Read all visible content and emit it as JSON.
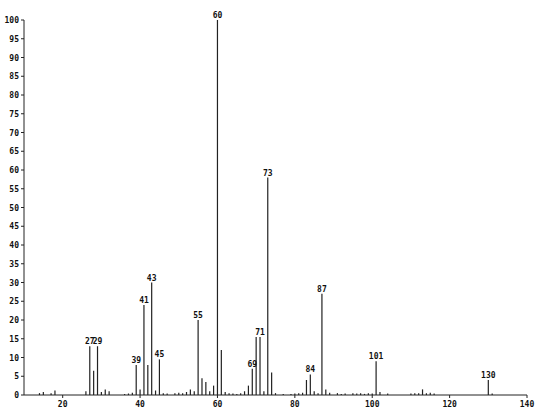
{
  "chart_data": {
    "type": "bar",
    "title": "",
    "xlabel": "",
    "ylabel": "",
    "xlim": [
      10,
      140
    ],
    "ylim": [
      0,
      100
    ],
    "grid": false,
    "legend": null,
    "x_ticks": [
      20,
      40,
      60,
      80,
      100,
      120,
      140
    ],
    "y_ticks": [
      0,
      5,
      10,
      15,
      20,
      25,
      30,
      35,
      40,
      45,
      50,
      55,
      60,
      65,
      70,
      75,
      80,
      85,
      90,
      95,
      100
    ],
    "labeled_peaks": [
      27,
      29,
      39,
      41,
      43,
      45,
      55,
      60,
      69,
      71,
      73,
      84,
      87,
      101,
      130
    ],
    "x": [
      14,
      15,
      17,
      18,
      26,
      27,
      28,
      29,
      30,
      31,
      32,
      36,
      37,
      38,
      39,
      40,
      41,
      42,
      43,
      44,
      45,
      46,
      47,
      49,
      50,
      51,
      52,
      53,
      54,
      55,
      56,
      57,
      58,
      59,
      60,
      61,
      62,
      63,
      64,
      65,
      66,
      67,
      68,
      69,
      70,
      71,
      72,
      73,
      74,
      75,
      77,
      79,
      80,
      81,
      82,
      83,
      84,
      85,
      86,
      87,
      88,
      89,
      91,
      92,
      93,
      95,
      96,
      97,
      98,
      99,
      100,
      101,
      102,
      104,
      110,
      111,
      112,
      113,
      114,
      115,
      116,
      130,
      131
    ],
    "values": [
      0.5,
      0.8,
      0.5,
      1.2,
      1,
      13,
      6.5,
      13,
      0.8,
      1.5,
      1,
      0.3,
      0.4,
      0.6,
      8,
      1.5,
      24,
      8,
      30,
      1.2,
      9.5,
      0.5,
      0.4,
      0.5,
      0.6,
      0.5,
      0.8,
      1.5,
      1,
      20,
      4.5,
      3.5,
      1,
      2.5,
      100,
      12,
      0.8,
      0.5,
      0.4,
      0.3,
      0.5,
      1,
      2.5,
      7,
      15.5,
      15.5,
      1,
      58,
      6,
      0.5,
      0.3,
      0.3,
      0.4,
      0.5,
      0.6,
      4,
      5.5,
      1,
      0.5,
      27,
      1.5,
      0.6,
      0.5,
      0.3,
      0.4,
      0.5,
      0.4,
      0.5,
      0.3,
      0.5,
      0.4,
      9,
      0.8,
      0.4,
      0.4,
      0.5,
      0.5,
      1.5,
      0.5,
      0.6,
      0.4,
      4,
      0.4
    ]
  }
}
